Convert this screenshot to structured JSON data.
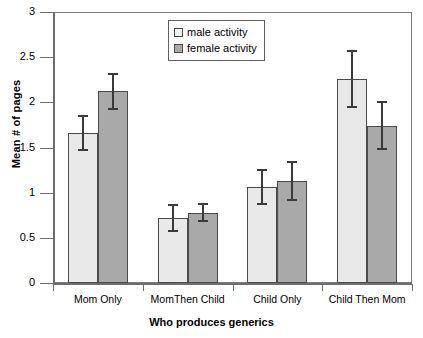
{
  "chart_data": {
    "type": "bar",
    "title": "",
    "xlabel": "Who produces generics",
    "ylabel": "Mean # of pages",
    "ylim": [
      0,
      3
    ],
    "yticks": [
      "0",
      "0.5",
      "1",
      "1.5",
      "2",
      "2.5",
      "3"
    ],
    "grid": false,
    "legend_position": "top-center",
    "categories": [
      "Mom Only",
      "MomThen Child",
      "Child Only",
      "Child Then Mom"
    ],
    "series": [
      {
        "name": "male activity",
        "color": "#e9e9e9",
        "values": [
          1.66,
          0.72,
          1.06,
          2.26
        ],
        "errors": [
          0.2,
          0.15,
          0.2,
          0.32
        ]
      },
      {
        "name": "female activity",
        "color": "#a9a9a9",
        "values": [
          2.12,
          0.78,
          1.13,
          1.74
        ],
        "errors": [
          0.21,
          0.11,
          0.22,
          0.27
        ]
      }
    ]
  },
  "legend": {
    "items": [
      {
        "label": "male activity"
      },
      {
        "label": "female activity"
      }
    ]
  },
  "axis": {
    "y_title": "Mean # of pages",
    "x_title": "Who produces generics",
    "y_tick_labels": [
      "3",
      "2.5",
      "2",
      "1.5",
      "1",
      "0.5",
      "0"
    ],
    "x_tick_labels": [
      "Mom Only",
      "MomThen Child",
      "Child Only",
      "Child Then Mom"
    ]
  }
}
